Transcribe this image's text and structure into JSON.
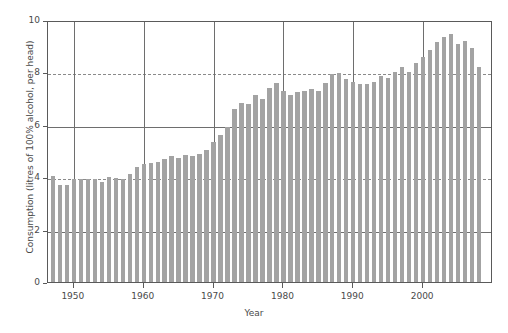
{
  "chart_data": {
    "type": "bar",
    "title": "",
    "xlabel": "Year",
    "ylabel": "Consumption (litres of 100% alcohol, per head)",
    "xlim": [
      1946.3,
      2010.0
    ],
    "ylim": [
      0,
      10
    ],
    "y_ticks": [
      0,
      2,
      4,
      6,
      8,
      10
    ],
    "y_tick_labels": [
      "0",
      "2",
      "4",
      "6",
      "8",
      "10"
    ],
    "x_ticks": [
      1950,
      1960,
      1970,
      1980,
      1990,
      2000
    ],
    "x_tick_labels": [
      "1950",
      "1960",
      "1970",
      "1980",
      "1990",
      "2000"
    ],
    "grid": "horizontal-and-vertical",
    "legend": "none",
    "bar_color": "#a3a3a3",
    "axis_color": "#5a5a5a",
    "grid_color": "#6e6e6e",
    "categories": [
      1947,
      1948,
      1949,
      1950,
      1951,
      1952,
      1953,
      1954,
      1955,
      1956,
      1957,
      1958,
      1959,
      1960,
      1961,
      1962,
      1963,
      1964,
      1965,
      1966,
      1967,
      1968,
      1969,
      1970,
      1971,
      1972,
      1973,
      1974,
      1975,
      1976,
      1977,
      1978,
      1979,
      1980,
      1981,
      1982,
      1983,
      1984,
      1985,
      1986,
      1987,
      1988,
      1989,
      1990,
      1991,
      1992,
      1993,
      1994,
      1995,
      1996,
      1997,
      1998,
      1999,
      2000,
      2001,
      2002,
      2003,
      2004,
      2005,
      2006,
      2007,
      2008
    ],
    "values": [
      4.05,
      3.7,
      3.72,
      3.95,
      3.93,
      3.93,
      3.92,
      3.8,
      4.02,
      3.98,
      3.95,
      4.12,
      4.4,
      4.52,
      4.55,
      4.58,
      4.68,
      4.8,
      4.72,
      4.85,
      4.82,
      4.9,
      5.02,
      5.35,
      5.62,
      5.9,
      6.6,
      6.85,
      6.8,
      7.15,
      7.0,
      7.4,
      7.6,
      7.3,
      7.15,
      7.25,
      7.3,
      7.35,
      7.3,
      7.6,
      7.95,
      7.98,
      7.75,
      7.65,
      7.55,
      7.55,
      7.65,
      7.85,
      7.8,
      8.0,
      8.2,
      8.0,
      8.35,
      8.6,
      8.85,
      9.15,
      9.35,
      9.45,
      9.1,
      9.2,
      8.95,
      8.2
    ]
  }
}
